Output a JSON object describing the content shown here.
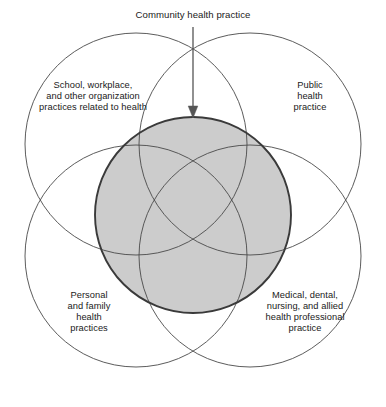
{
  "diagram": {
    "type": "venn",
    "title": "Community health practice",
    "title_annotation_target": "central-shaded-circle",
    "colors": {
      "background": "#ffffff",
      "circle_stroke": "#4a4a4a",
      "center_fill": "#cccccc",
      "center_stroke": "#3a3a3a",
      "arrow": "#555555",
      "text": "#1a1a1a"
    },
    "center_region": {
      "name": "Community health practice",
      "fill": "#cccccc"
    },
    "sets": [
      {
        "id": "top-left",
        "position": "top-left",
        "lines": [
          "School, workplace,",
          "and other organization",
          "practices related to health"
        ],
        "text": "School, workplace, and other organization practices related to health"
      },
      {
        "id": "top-right",
        "position": "top-right",
        "lines": [
          "Public",
          "health",
          "practice"
        ],
        "text": "Public health practice"
      },
      {
        "id": "bottom-left",
        "position": "bottom-left",
        "lines": [
          "Personal",
          "and family",
          "health",
          "practices"
        ],
        "text": "Personal and family health practices"
      },
      {
        "id": "bottom-right",
        "position": "bottom-right",
        "lines": [
          "Medical, dental,",
          "nursing, and allied",
          "health professional",
          "practice"
        ],
        "text": "Medical, dental, nursing, and allied health professional practice"
      }
    ]
  }
}
